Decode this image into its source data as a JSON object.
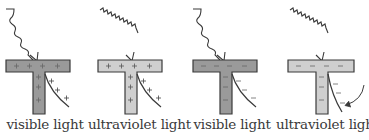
{
  "diagram": {
    "type": "electroscope-photoelectric-effect",
    "colors": {
      "outline": "#3a3a3a",
      "dark_fill": "#9a9a9a",
      "light_fill": "#cfcfcf",
      "sign_color": "#555555"
    },
    "panels": [
      {
        "label": "visible light",
        "charge": "positive",
        "fill": "dark",
        "leaf": "raised",
        "arrow": false,
        "wave": "loose"
      },
      {
        "label": "ultraviolet light",
        "charge": "positive",
        "fill": "light",
        "leaf": "raised",
        "arrow": false,
        "wave": "tight"
      },
      {
        "label": "visible light",
        "charge": "negative",
        "fill": "dark",
        "leaf": "raised",
        "arrow": false,
        "wave": "loose"
      },
      {
        "label": "ultraviolet light",
        "charge": "negative",
        "fill": "light",
        "leaf": "falling",
        "arrow": true,
        "wave": "tight"
      }
    ]
  }
}
